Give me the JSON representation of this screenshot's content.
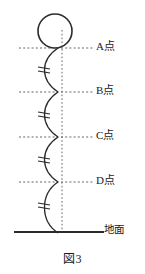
{
  "figure": {
    "caption": "図3",
    "ground_label": "地面",
    "colors": {
      "stroke": "#2b2b2b",
      "dashed": "#555555",
      "background": "#ffffff"
    },
    "points": [
      {
        "id": "A",
        "label": "A点",
        "y": 48
      },
      {
        "id": "B",
        "label": "B点",
        "y": 92
      },
      {
        "id": "C",
        "label": "C点",
        "y": 137
      },
      {
        "id": "D",
        "label": "D点",
        "y": 182
      }
    ],
    "ball": {
      "name": "ball",
      "cx": 55,
      "cy": 31,
      "r": 17
    },
    "ground": {
      "y": 232,
      "x1": 14,
      "x2": 104
    },
    "axis": {
      "x": 62,
      "y1": 30,
      "y2": 234
    },
    "segments": [
      {
        "from": "A",
        "to": "B",
        "tick": "="
      },
      {
        "from": "B",
        "to": "C",
        "tick": "="
      },
      {
        "from": "C",
        "to": "D",
        "tick": "="
      },
      {
        "from": "D",
        "to": "地面",
        "tick": "="
      }
    ]
  }
}
